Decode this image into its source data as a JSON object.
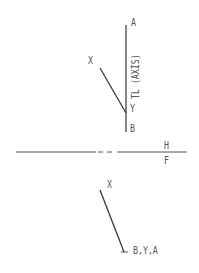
{
  "diagram": {
    "top_view": {
      "labels": {
        "a": "A",
        "x": "X",
        "y": "Y",
        "b": "B",
        "axis": "TL (AXIS)"
      }
    },
    "fold_line": {
      "upper_label": "H",
      "lower_label": "F"
    },
    "front_view": {
      "labels": {
        "x": "X",
        "point": "B,Y,A"
      }
    },
    "colors": {
      "line": "#3a3a3a",
      "text": "#555555",
      "background": "#ffffff"
    }
  }
}
